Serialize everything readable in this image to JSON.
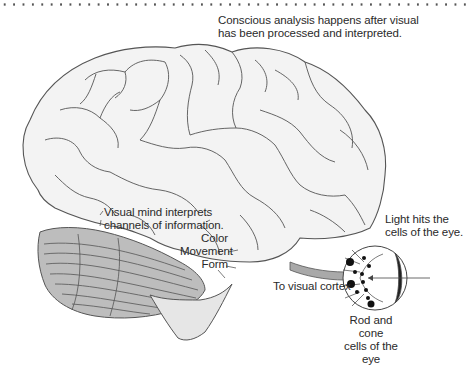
{
  "diagram": {
    "type": "brain-visual-pathway-illustration",
    "colors": {
      "brain_fill": "#f3f3f3",
      "brain_outline": "#555555",
      "cerebellum_fill": "#bdbdbd",
      "optic_nerve_fill": "#a9a9a9",
      "background": "#ffffff",
      "text": "#2a2a2a"
    },
    "labels": {
      "conscious_analysis": {
        "line1": "Conscious analysis happens after visual",
        "line2": "has been processed and interpreted."
      },
      "visual_mind": {
        "line1": "Visual mind interprets",
        "line2": "channels of information."
      },
      "channels": {
        "color": "Color",
        "movement": "Movement",
        "form": "Form"
      },
      "light_hits": {
        "line1": "Light hits the",
        "line2": "cells of the eye."
      },
      "to_visual_cortex": "To visual cortex",
      "rod_cone": {
        "line1": "Rod and cone",
        "line2": "cells of the eye"
      }
    }
  }
}
